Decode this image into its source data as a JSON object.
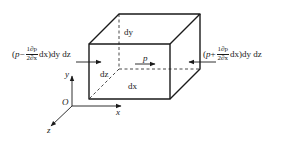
{
  "diagram": {
    "type": "fluid-element-pressure-forces",
    "element_labels": {
      "height": "dy",
      "depth": "dz",
      "width": "dx",
      "pressure": "p"
    },
    "left_force": {
      "open": "(",
      "p": "p",
      "op": "−",
      "frac_num": "1∂p",
      "frac_den": "2∂x",
      "tail": "dx)dy dz"
    },
    "right_force": {
      "open": "(",
      "p": "p",
      "op": "+",
      "frac_num": "1∂p",
      "frac_den": "2∂x",
      "tail": "dx)dy dz"
    },
    "axes": {
      "origin": "O",
      "x": "x",
      "y": "y",
      "z": "z"
    },
    "colors": {
      "line": "#1a1a1a",
      "background": "#ffffff"
    }
  }
}
